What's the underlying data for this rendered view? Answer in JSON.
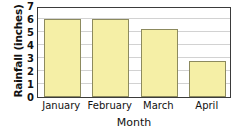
{
  "chart_data": {
    "type": "bar",
    "title": "",
    "xlabel": "Month",
    "ylabel": "Rainfall (inches)",
    "categories": [
      "January",
      "February",
      "March",
      "April"
    ],
    "values": [
      6,
      6,
      5.2,
      2.8
    ],
    "ylim": [
      0,
      7
    ],
    "ytick_labels": [
      "7",
      "6",
      "5",
      "4",
      "3",
      "2",
      "1",
      "0"
    ],
    "ytick_values": [
      7,
      6,
      5,
      4,
      3,
      2,
      1,
      0
    ],
    "grid": true,
    "legend": "none",
    "bar_fill_color": "#f5efa6",
    "bar_border_color": "#8c8a5e",
    "grid_color": "#d2d2d2",
    "frame_color": "#3b3b3b"
  }
}
